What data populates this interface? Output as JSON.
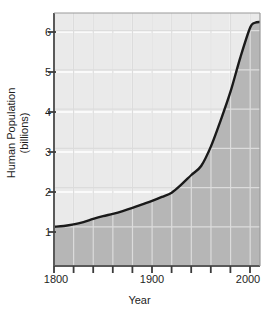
{
  "chart_data": {
    "type": "area",
    "title": "",
    "xlabel": "Year",
    "ylabel_line1": "Human Population",
    "ylabel_line2": "(billions)",
    "xlim": [
      1800,
      2010
    ],
    "ylim": [
      0,
      6.45
    ],
    "x_major_ticks": [
      1800,
      1900,
      2000
    ],
    "x_major_tick_labels": [
      "1800",
      "1900",
      "2000"
    ],
    "x_minor_tick_interval": 20,
    "x_minor_ticks": [
      1800,
      1820,
      1840,
      1860,
      1880,
      1900,
      1920,
      1940,
      1960,
      1980,
      2000
    ],
    "y_ticks": [
      1,
      2,
      3,
      4,
      5,
      6
    ],
    "y_tick_labels": [
      "1",
      "2",
      "3",
      "4",
      "5",
      "6"
    ],
    "grid": true,
    "grid_color": "#ffffff",
    "legend": "none",
    "series": [
      {
        "name": "Human Population",
        "x": [
          1800,
          1810,
          1820,
          1830,
          1840,
          1850,
          1860,
          1870,
          1880,
          1890,
          1900,
          1910,
          1920,
          1930,
          1940,
          1950,
          1960,
          1970,
          1980,
          1990,
          2000,
          2005,
          2010
        ],
        "values": [
          1.0,
          1.02,
          1.06,
          1.12,
          1.2,
          1.27,
          1.33,
          1.4,
          1.48,
          1.57,
          1.66,
          1.76,
          1.87,
          2.08,
          2.32,
          2.55,
          3.05,
          3.72,
          4.45,
          5.32,
          6.08,
          6.2,
          6.22
        ]
      }
    ],
    "fill_below_color": "#b6b6b6",
    "plot_background_color": "#eaeaea",
    "line_color": "#1a1a1a",
    "axis_color": "#4d4d4d"
  }
}
